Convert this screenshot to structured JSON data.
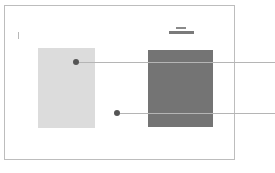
{
  "diagram": {
    "frame": {
      "border_color": "#bdbdbd"
    },
    "boxes": [
      {
        "id": "light",
        "fill": "#dcdcdc"
      },
      {
        "id": "dark",
        "fill": "#747474"
      }
    ],
    "markers": [
      {
        "id": "marker-1",
        "color": "#555555",
        "target": "light-box"
      },
      {
        "id": "marker-2",
        "color": "#555555",
        "target": "between-boxes"
      }
    ],
    "icons": {
      "header_icon": "dash-icon",
      "left_tick": "tick-mark-icon"
    },
    "leader_color": "#b5b5b5"
  }
}
